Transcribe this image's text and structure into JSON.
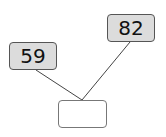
{
  "diagram": {
    "type": "number-bond",
    "parts": [
      {
        "id": "left",
        "value": "59"
      },
      {
        "id": "right",
        "value": "82"
      }
    ],
    "whole": {
      "id": "answer",
      "value": ""
    },
    "colors": {
      "part_fill": "#dcdcdc",
      "answer_fill": "#ffffff",
      "border": "#555555",
      "line": "#444444"
    }
  }
}
